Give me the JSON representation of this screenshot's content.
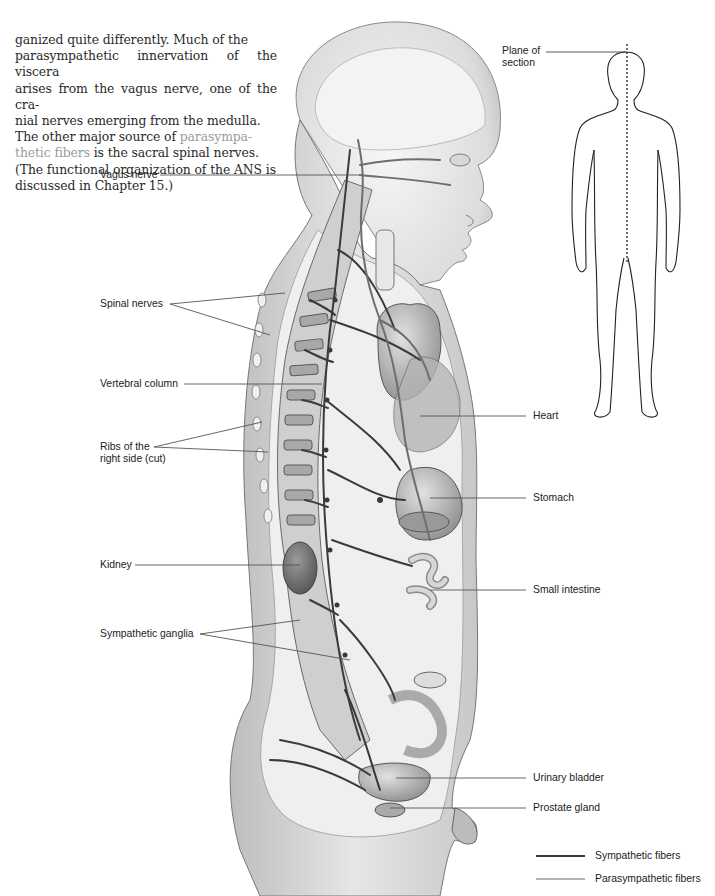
{
  "paragraph": {
    "lines": [
      "ganized quite differently. Much of the",
      "parasympathetic innervation of the viscera",
      "arises from the vagus nerve, one of the cra-",
      "nial nerves emerging from the medulla.",
      "The other major source of "
    ],
    "term_part1": "parasympa-",
    "term_part2": "thetic fibers",
    "after_term": " is the sacral spinal nerves.",
    "last_line": "(The functional organization of the ANS is",
    "last_line_cont": "discussed in Chapter 15.)"
  },
  "figure": {
    "inset": {
      "label_line1": "Plane of",
      "label_line2": "section"
    },
    "labels_left": {
      "vagus_nerve": "Vagus nerve",
      "spinal_nerves": "Spinal nerves",
      "vertebral_column": "Vertebral column",
      "ribs_line1": "Ribs of the",
      "ribs_line2": "right side (cut)",
      "kidney": "Kidney",
      "sympathetic_ganglia": "Sympathetic ganglia"
    },
    "labels_right": {
      "heart": "Heart",
      "stomach": "Stomach",
      "small_intestine": "Small intestine",
      "urinary_bladder": "Urinary bladder",
      "prostate_gland": "Prostate gland"
    },
    "legend": {
      "items": [
        {
          "label": "Sympathetic fibers",
          "color": "#3a3a3a"
        },
        {
          "label": "Parasympathetic fibers",
          "color": "#9a9a9a"
        }
      ]
    }
  },
  "colors": {
    "body_text": "#2a2a2a",
    "key_term": "#9b9b9b",
    "leader_line": "#555555"
  }
}
